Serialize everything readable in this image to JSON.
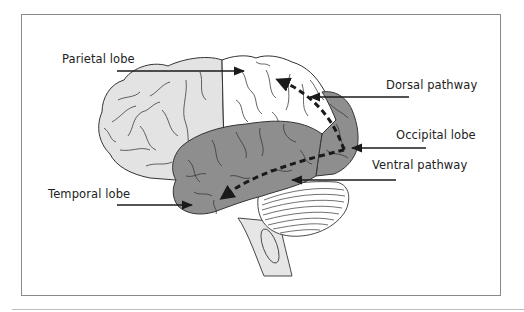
{
  "figure": {
    "labels": {
      "parietal": "Parietal lobe",
      "dorsal": "Dorsal pathway",
      "occipital": "Occipital lobe",
      "ventral": "Ventral pathway",
      "temporal": "Temporal lobe"
    },
    "colors": {
      "frontal_fill": "#e3e3e3",
      "parietal_fill": "#ffffff",
      "temporal_occipital_fill": "#8e8e8e",
      "cerebellum_fill": "#ffffff",
      "brainstem_fill": "#e6e6e6",
      "outline": "#333333",
      "arrow": "#1a1a1a",
      "frame": "#8a8a8a"
    }
  }
}
